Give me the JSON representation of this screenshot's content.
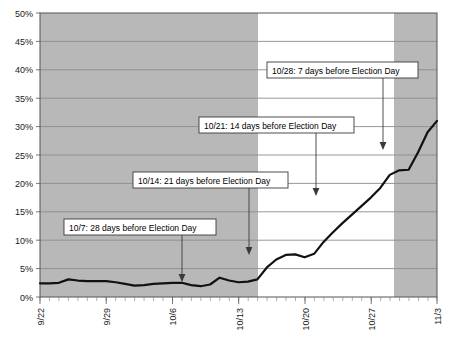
{
  "chart_data": {
    "type": "line",
    "title": "",
    "xlabel": "",
    "ylabel": "",
    "ylim": [
      0,
      50
    ],
    "yticks": [
      0,
      5,
      10,
      15,
      20,
      25,
      30,
      35,
      40,
      45,
      50
    ],
    "ytick_labels": [
      "0%",
      "5%",
      "10%",
      "15%",
      "20%",
      "25%",
      "30%",
      "35%",
      "40%",
      "45%",
      "50%"
    ],
    "xtick_labels": [
      "9/22",
      "9/29",
      "10/6",
      "10/13",
      "10/20",
      "10/27",
      "11/3"
    ],
    "x_start": "9/22",
    "x_end": "11/3",
    "grid": true,
    "legend": "none",
    "series": [
      {
        "name": "Share",
        "x": [
          "9/22",
          "9/23",
          "9/24",
          "9/25",
          "9/26",
          "9/27",
          "9/28",
          "9/29",
          "9/30",
          "10/1",
          "10/2",
          "10/3",
          "10/4",
          "10/5",
          "10/6",
          "10/7",
          "10/8",
          "10/9",
          "10/10",
          "10/11",
          "10/12",
          "10/13",
          "10/14",
          "10/15",
          "10/16",
          "10/17",
          "10/18",
          "10/19",
          "10/20",
          "10/21",
          "10/22",
          "10/23",
          "10/24",
          "10/25",
          "10/26",
          "10/27",
          "10/28",
          "10/29",
          "10/30",
          "10/31",
          "11/1",
          "11/2",
          "11/3"
        ],
        "values": [
          2.4,
          2.4,
          2.5,
          3.1,
          2.9,
          2.8,
          2.8,
          2.8,
          2.6,
          2.3,
          2.0,
          2.1,
          2.3,
          2.4,
          2.5,
          2.5,
          2.1,
          1.9,
          2.2,
          3.4,
          2.9,
          2.6,
          2.7,
          3.1,
          5.2,
          6.6,
          7.4,
          7.5,
          7.0,
          7.6,
          9.7,
          11.4,
          13.0,
          14.5,
          16.0,
          17.5,
          19.2,
          21.5,
          22.3,
          22.4,
          25.5,
          29.0,
          31.0
        ]
      }
    ],
    "shaded_bands": [
      {
        "from": "9/22",
        "to": "10/14",
        "color": "#b8b8b8"
      },
      {
        "from": "10/14",
        "to": "10/29",
        "color": "#ffffff"
      },
      {
        "from": "10/29",
        "to": "11/3",
        "color": "#b8b8b8"
      }
    ],
    "annotations": [
      {
        "id": "annot-10-7",
        "label": "10/7: 28 days before Election Day",
        "target_x": "10/7",
        "target_y": 2.5
      },
      {
        "id": "annot-10-14",
        "label": "10/14: 21 days before Election Day",
        "target_x": "10/14",
        "target_y": 7.5
      },
      {
        "id": "annot-10-21",
        "label": "10/21: 14 days before Election Day",
        "target_x": "10/21",
        "target_y": 17.0
      },
      {
        "id": "annot-10-28",
        "label": "10/28: 7 days before Election Day",
        "target_x": "10/28",
        "target_y": 27.0
      }
    ]
  },
  "axis": {
    "y_labels": [
      "50%",
      "45%",
      "40%",
      "35%",
      "30%",
      "25%",
      "20%",
      "15%",
      "10%",
      "5%",
      "0%"
    ],
    "x_labels": [
      "9/22",
      "9/29",
      "10/6",
      "10/13",
      "10/20",
      "10/27",
      "11/3"
    ]
  },
  "callouts": {
    "c1": "10/28: 7 days before Election Day",
    "c2": "10/21: 14 days before Election Day",
    "c3": "10/14: 21 days before Election Day",
    "c4": "10/7: 28 days before Election Day"
  },
  "colors": {
    "band_shaded": "#b8b8b8",
    "band_white": "#ffffff",
    "line": "#111111",
    "grid": "#8c8c8c",
    "border": "#555555",
    "callout_border": "#3a3a3a",
    "text": "#1a1a1a"
  }
}
